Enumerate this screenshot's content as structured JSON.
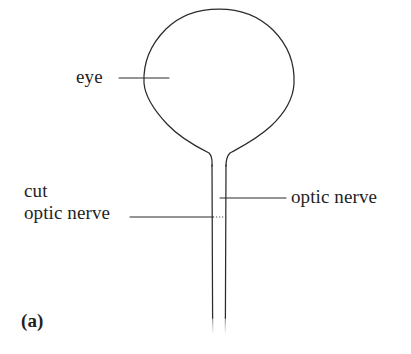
{
  "figure": {
    "panel_label": "(a)",
    "background_color": "#ffffff",
    "stroke_color": "#2b2b2b",
    "text_color": "#1f1f1f",
    "labels": {
      "eye": "eye",
      "cut_line1": "cut",
      "cut_line2": "optic nerve",
      "optic_nerve": "optic nerve"
    }
  },
  "diagram_data": {
    "type": "line-drawing",
    "description": "Schematic side view of an eyeball with its optic nerve stalk; leader lines label the eye, the optic nerve, and the location where the optic nerve is cut.",
    "parts": [
      {
        "name": "eye",
        "shape": "circle",
        "center": [
          219,
          85
        ],
        "radius": 75
      },
      {
        "name": "optic-nerve-stalk",
        "shape": "parallel-lines",
        "left_x": 212,
        "right_x": 225,
        "top_y": 160,
        "bottom_y": 322
      },
      {
        "name": "cut-marker",
        "shape": "dotted-segment",
        "from": [
          212,
          217
        ],
        "to": [
          226,
          217
        ]
      }
    ],
    "leaders": [
      {
        "label": "eye",
        "from": [
          120,
          78
        ],
        "to": [
          168,
          78
        ]
      },
      {
        "label": "optic nerve",
        "from": [
          285,
          198
        ],
        "to": [
          224,
          198
        ]
      },
      {
        "label": "cut optic nerve",
        "from": [
          131,
          217
        ],
        "to": [
          212,
          217
        ]
      }
    ]
  }
}
